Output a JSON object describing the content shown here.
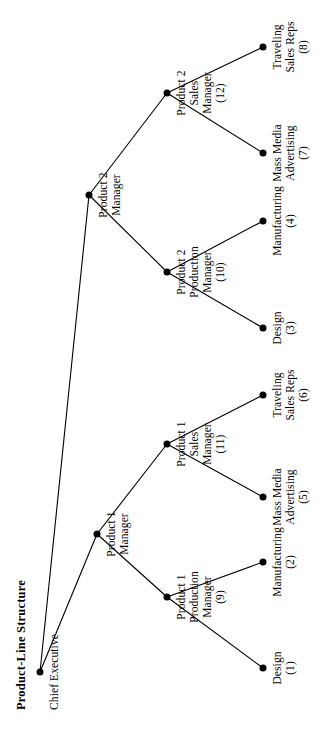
{
  "figure": {
    "title": "Product-Line Structure",
    "orientation": "rotated-90-clockwise",
    "background_color": "#ffffff",
    "ink_color": "#000000"
  },
  "chart_data": {
    "type": "diagram",
    "diagram_kind": "organizational-tree",
    "title": "Product-Line Structure",
    "root_id": "chief-executive",
    "nodes": [
      {
        "id": "chief-executive",
        "label": "Chief Executive",
        "index": "",
        "level": 0,
        "parent": null,
        "x": 60,
        "y": 40
      },
      {
        "id": "product-1-manager",
        "label": "Product 1\nManager",
        "index": "",
        "level": 1,
        "parent": "chief-executive",
        "x": 198,
        "y": 97
      },
      {
        "id": "product-2-manager",
        "label": "Product 2\nManager",
        "index": "",
        "level": 1,
        "parent": "chief-executive",
        "x": 537,
        "y": 89
      },
      {
        "id": "product-1-production-manager",
        "label": "Product 1\nProduction\nManager",
        "index": "(9)",
        "level": 2,
        "parent": "product-1-manager",
        "x": 135,
        "y": 167
      },
      {
        "id": "product-1-sales-manager",
        "label": "Product 1\nSales\nManager",
        "index": "(11)",
        "level": 2,
        "parent": "product-1-manager",
        "x": 288,
        "y": 167
      },
      {
        "id": "product-2-production-manager",
        "label": "Product 2\nProduction\nManager",
        "index": "(10)",
        "level": 2,
        "parent": "product-2-manager",
        "x": 460,
        "y": 167
      },
      {
        "id": "product-2-sales-manager",
        "label": "Product 2\nSales\nManager",
        "index": "(12)",
        "level": 2,
        "parent": "product-2-manager",
        "x": 639,
        "y": 167
      },
      {
        "id": "design-1",
        "label": "Design",
        "index": "(1)",
        "level": 3,
        "parent": "product-1-production-manager",
        "x": 64,
        "y": 263
      },
      {
        "id": "manufacturing-2",
        "label": "Manufacturing",
        "index": "(2)",
        "level": 3,
        "parent": "product-1-production-manager",
        "x": 170,
        "y": 263
      },
      {
        "id": "mass-media-advertising-5",
        "label": "Mass Media\nAdvertising",
        "index": "(5)",
        "level": 3,
        "parent": "product-1-sales-manager",
        "x": 235,
        "y": 263
      },
      {
        "id": "traveling-sales-reps-6",
        "label": "Traveling\nSales Reps",
        "index": "(6)",
        "level": 3,
        "parent": "product-1-sales-manager",
        "x": 337,
        "y": 263
      },
      {
        "id": "design-3",
        "label": "Design",
        "index": "(3)",
        "level": 3,
        "parent": "product-2-production-manager",
        "x": 404,
        "y": 263
      },
      {
        "id": "manufacturing-4",
        "label": "Manufacturing",
        "index": "(4)",
        "level": 3,
        "parent": "product-2-production-manager",
        "x": 511,
        "y": 263
      },
      {
        "id": "mass-media-advertising-7",
        "label": "Mass Media\nAdvertising",
        "index": "(7)",
        "level": 3,
        "parent": "product-2-sales-manager",
        "x": 579,
        "y": 263
      },
      {
        "id": "traveling-sales-reps-8",
        "label": "Traveling\nSales Reps",
        "index": "(8)",
        "level": 3,
        "parent": "product-2-sales-manager",
        "x": 685,
        "y": 263
      }
    ],
    "edges": [
      {
        "from": "chief-executive",
        "to": "product-1-manager"
      },
      {
        "from": "chief-executive",
        "to": "product-2-manager"
      },
      {
        "from": "product-1-manager",
        "to": "product-1-production-manager"
      },
      {
        "from": "product-1-manager",
        "to": "product-1-sales-manager"
      },
      {
        "from": "product-2-manager",
        "to": "product-2-production-manager"
      },
      {
        "from": "product-2-manager",
        "to": "product-2-sales-manager"
      },
      {
        "from": "product-1-production-manager",
        "to": "design-1"
      },
      {
        "from": "product-1-production-manager",
        "to": "manufacturing-2"
      },
      {
        "from": "product-1-sales-manager",
        "to": "mass-media-advertising-5"
      },
      {
        "from": "product-1-sales-manager",
        "to": "traveling-sales-reps-6"
      },
      {
        "from": "product-2-production-manager",
        "to": "design-3"
      },
      {
        "from": "product-2-production-manager",
        "to": "manufacturing-4"
      },
      {
        "from": "product-2-sales-manager",
        "to": "mass-media-advertising-7"
      },
      {
        "from": "product-2-sales-manager",
        "to": "traveling-sales-reps-8"
      }
    ]
  }
}
